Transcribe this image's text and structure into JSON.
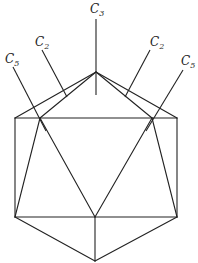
{
  "figure": {
    "labels": {
      "c3": {
        "main": "C",
        "sub": "3"
      },
      "c2_left": {
        "main": "C",
        "sub": "2"
      },
      "c2_right": {
        "main": "C",
        "sub": "2"
      },
      "c5_left": {
        "main": "C",
        "sub": "5"
      },
      "c5_right": {
        "main": "C",
        "sub": "5"
      }
    }
  }
}
